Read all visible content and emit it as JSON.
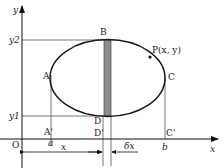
{
  "diagram": {
    "type": "ellipse area by vertical strips",
    "axes": {
      "x_label": "x",
      "y_label": "y",
      "origin_label": "O"
    },
    "points": {
      "A": "A",
      "B": "B",
      "C": "C",
      "D": "D",
      "A_prime": "A'",
      "D_prime": "D'",
      "C_prime": "C'",
      "P": "P(x, y)"
    },
    "ticks": {
      "y_upper": "y2",
      "y_lower": "y1",
      "x_left": "a",
      "x_right": "b"
    },
    "dimensions": {
      "x_span": "x",
      "strip_width": "δx"
    },
    "colors": {
      "stroke": "#1a1a1a",
      "strip_fill": "#8c8c8c",
      "guide": "#555555"
    }
  }
}
